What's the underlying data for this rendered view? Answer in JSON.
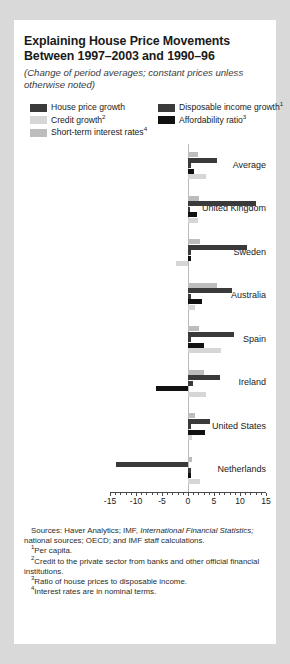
{
  "title": "Explaining House Price Movements Between 1997–2003 and 1990–96",
  "subtitle": "(Change of period averages; constant prices unless otherwise noted)",
  "legend": {
    "items": [
      {
        "label": "House price growth",
        "sup": "",
        "color": "#3a3a3a"
      },
      {
        "label": "Disposable income growth",
        "sup": "1",
        "color": "#3a3a3a"
      },
      {
        "label": "Credit growth",
        "sup": "2",
        "color": "#d6d6d6"
      },
      {
        "label": "Affordability ratio",
        "sup": "3",
        "color": "#111111"
      },
      {
        "label": "Short-term interest rates",
        "sup": "4",
        "color": "#bdbdbd"
      }
    ]
  },
  "notes": {
    "sources_label": "Sources:",
    "sources_text_a": " Haver Analytics; IMF, ",
    "sources_italic": "International Financial Statistics;",
    "sources_text_b": " national sources; OECD; and IMF staff calculations.",
    "fn1_num": "1",
    "fn1": "Per capita.",
    "fn2_num": "2",
    "fn2": "Credit to the private sector from banks and other official financial institutions.",
    "fn3_num": "3",
    "fn3": "Ratio of house prices to disposable income.",
    "fn4_num": "4",
    "fn4": "Interest rates are in nominal terms."
  },
  "chart_data": {
    "type": "bar",
    "orientation": "horizontal",
    "title": "Explaining House Price Movements Between 1997–2003 and 1990–96",
    "subtitle": "(Change of period averages; constant prices unless otherwise noted)",
    "xlabel": "",
    "ylabel": "",
    "xlim": [
      -15,
      15
    ],
    "xticks": [
      -15,
      -10,
      -5,
      0,
      5,
      10,
      15
    ],
    "xticklabels": [
      "-15",
      "-10",
      "-5",
      "0",
      "5",
      "10",
      "15"
    ],
    "grid": false,
    "legend_position": "top",
    "categories": [
      "Average",
      "United Kingdom",
      "Sweden",
      "Australia",
      "Spain",
      "Ireland",
      "United States",
      "Netherlands"
    ],
    "series": [
      {
        "name": "Short-term interest rates",
        "color": "#bdbdbd",
        "values": [
          2.0,
          2.2,
          2.4,
          5.6,
          2.1,
          3.0,
          1.4,
          0.8
        ]
      },
      {
        "name": "House price growth",
        "color": "#3a3a3a",
        "values": [
          5.6,
          13.0,
          11.4,
          8.4,
          8.9,
          6.1,
          4.3,
          -13.9
        ]
      },
      {
        "name": "Disposable income growth",
        "color": "#3a3a3a",
        "values": [
          0.6,
          0.4,
          0.5,
          0.5,
          0.5,
          0.9,
          0.6,
          0.5
        ]
      },
      {
        "name": "Affordability ratio",
        "color": "#111111",
        "values": [
          1.1,
          1.7,
          0.6,
          2.6,
          3.0,
          -6.2,
          3.2,
          0.5
        ]
      },
      {
        "name": "Credit growth",
        "color": "#d6d6d6",
        "values": [
          3.4,
          1.9,
          -2.4,
          1.3,
          6.3,
          3.5,
          0.7,
          2.4
        ]
      }
    ]
  }
}
